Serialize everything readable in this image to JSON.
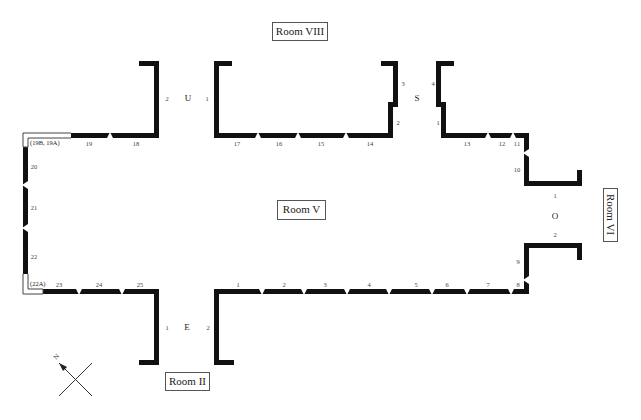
{
  "rooms": {
    "main": "Room V",
    "north": "Room VIII",
    "south": "Room II",
    "east": "Room VI"
  },
  "doorways": {
    "U": {
      "label": "U",
      "left_jamb": "2",
      "right_jamb": "1"
    },
    "S": {
      "label": "S",
      "left_upper": "3",
      "left_lower": "2",
      "right_upper": "4",
      "right_lower": "1"
    },
    "E": {
      "label": "E",
      "left_jamb": "1",
      "right_jamb": "2"
    },
    "O": {
      "label": "O",
      "top": "1",
      "bottom": "2"
    }
  },
  "corner_labels": {
    "top_left": "(19B, 19A)",
    "bottom_left": "(22A)"
  },
  "top_wall_panels": [
    "19",
    "18",
    "17",
    "16",
    "15",
    "14",
    "13",
    "12",
    "11"
  ],
  "right_wall_panels": [
    "10",
    "9"
  ],
  "bottom_wall_panels": [
    "23",
    "24",
    "25",
    "1",
    "2",
    "3",
    "4",
    "5",
    "6",
    "7",
    "8"
  ],
  "left_wall_panels": [
    "20",
    "21",
    "22"
  ],
  "compass": {
    "icon": "north-arrow-icon",
    "label": "N"
  }
}
